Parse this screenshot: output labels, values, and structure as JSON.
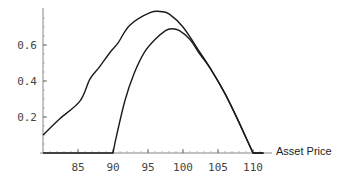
{
  "chart_data": {
    "type": "line",
    "title": "",
    "xlabel": "Asset Price",
    "ylabel": "",
    "xlim": [
      80,
      111.5
    ],
    "ylim": [
      0,
      0.8
    ],
    "grid": false,
    "legend": null,
    "x_ticks": [
      85,
      90,
      95,
      100,
      105,
      110
    ],
    "y_ticks": [
      0.2,
      0.4,
      0.6
    ],
    "x_tick_labels": [
      "85",
      "90",
      "95",
      "100",
      "105",
      "110"
    ],
    "y_tick_labels": [
      "0.2",
      "0.4",
      "0.6"
    ],
    "series": [
      {
        "name": "upper-curve",
        "x": [
          80,
          82.4,
          85.3,
          86.7,
          88.1,
          89.6,
          90.7,
          92.4,
          95.3,
          97,
          98.1,
          100,
          102.4,
          103.9,
          106,
          108,
          110,
          111.5
        ],
        "y": [
          0.1,
          0.19,
          0.29,
          0.41,
          0.48,
          0.56,
          0.61,
          0.71,
          0.78,
          0.785,
          0.77,
          0.7,
          0.56,
          0.47,
          0.33,
          0.17,
          0.0,
          0.0
        ]
      },
      {
        "name": "lower-curve",
        "x": [
          80,
          90,
          90.3,
          91.7,
          93,
          94.5,
          96,
          97.5,
          98.4,
          99.5,
          101,
          102.4,
          103.9,
          106,
          108,
          110,
          111.5
        ],
        "y": [
          0.0,
          0.0,
          0.06,
          0.29,
          0.44,
          0.56,
          0.63,
          0.68,
          0.69,
          0.68,
          0.63,
          0.55,
          0.47,
          0.33,
          0.17,
          0.0,
          0.0
        ]
      }
    ]
  },
  "axes": {
    "x_label": "Asset Price"
  }
}
